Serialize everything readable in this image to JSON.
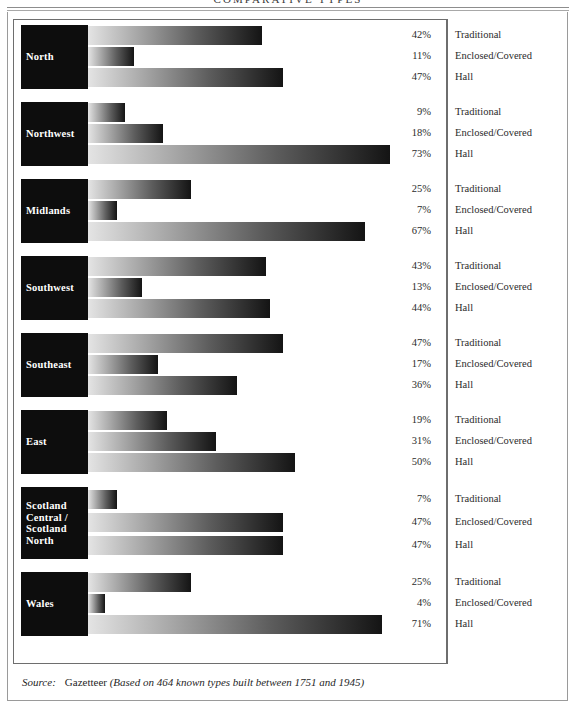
{
  "title": "COMPARATIVE TYPES",
  "source": {
    "label": "Source:",
    "name": "Gazetteer",
    "note": "(Based on 464 known types built between 1751 and 1945)"
  },
  "chart_data": {
    "type": "bar",
    "title": "COMPARATIVE TYPES",
    "orientation": "horizontal",
    "grouped": true,
    "xlabel": "",
    "ylabel": "",
    "xlim": [
      0,
      73
    ],
    "grid": false,
    "legend_position": "right-inline",
    "categories": [
      "North",
      "Northwest",
      "Midlands",
      "Southwest",
      "Southeast",
      "East",
      "Scotland Central / Scotland North",
      "Wales"
    ],
    "series": [
      {
        "name": "Traditional",
        "values": [
          42,
          9,
          25,
          43,
          47,
          19,
          7,
          25
        ]
      },
      {
        "name": "Enclosed/Covered",
        "values": [
          11,
          18,
          7,
          13,
          17,
          31,
          47,
          4
        ]
      },
      {
        "name": "Hall",
        "values": [
          47,
          73,
          67,
          44,
          36,
          50,
          47,
          71
        ]
      }
    ],
    "groups": [
      {
        "region": "North",
        "region_lines": [
          "North"
        ],
        "rows": [
          {
            "value": 42,
            "value_label": "42%",
            "legend": "Traditional"
          },
          {
            "value": 11,
            "value_label": "11%",
            "legend": "Enclosed/Covered"
          },
          {
            "value": 47,
            "value_label": "47%",
            "legend": "Hall"
          }
        ]
      },
      {
        "region": "Northwest",
        "region_lines": [
          "Northwest"
        ],
        "rows": [
          {
            "value": 9,
            "value_label": "9%",
            "legend": "Traditional"
          },
          {
            "value": 18,
            "value_label": "18%",
            "legend": "Enclosed/Covered"
          },
          {
            "value": 73,
            "value_label": "73%",
            "legend": "Hall"
          }
        ]
      },
      {
        "region": "Midlands",
        "region_lines": [
          "Midlands"
        ],
        "rows": [
          {
            "value": 25,
            "value_label": "25%",
            "legend": "Traditional"
          },
          {
            "value": 7,
            "value_label": "7%",
            "legend": "Enclosed/Covered"
          },
          {
            "value": 67,
            "value_label": "67%",
            "legend": "Hall"
          }
        ]
      },
      {
        "region": "Southwest",
        "region_lines": [
          "Southwest"
        ],
        "rows": [
          {
            "value": 43,
            "value_label": "43%",
            "legend": "Traditional"
          },
          {
            "value": 13,
            "value_label": "13%",
            "legend": "Enclosed/Covered"
          },
          {
            "value": 44,
            "value_label": "44%",
            "legend": "Hall"
          }
        ]
      },
      {
        "region": "Southeast",
        "region_lines": [
          "Southeast"
        ],
        "rows": [
          {
            "value": 47,
            "value_label": "47%",
            "legend": "Traditional"
          },
          {
            "value": 17,
            "value_label": "17%",
            "legend": "Enclosed/Covered"
          },
          {
            "value": 36,
            "value_label": "36%",
            "legend": "Hall"
          }
        ]
      },
      {
        "region": "East",
        "region_lines": [
          "East"
        ],
        "rows": [
          {
            "value": 19,
            "value_label": "19%",
            "legend": "Traditional"
          },
          {
            "value": 31,
            "value_label": "31%",
            "legend": "Enclosed/Covered"
          },
          {
            "value": 50,
            "value_label": "50%",
            "legend": "Hall"
          }
        ]
      },
      {
        "region": "Scotland Central / Scotland North",
        "region_lines": [
          "Scotland",
          "Central /",
          "Scotland",
          "North"
        ],
        "rows": [
          {
            "value": 7,
            "value_label": "7%",
            "legend": "Traditional"
          },
          {
            "value": 47,
            "value_label": "47%",
            "legend": "Enclosed/Covered"
          },
          {
            "value": 47,
            "value_label": "47%",
            "legend": "Hall"
          }
        ]
      },
      {
        "region": "Wales",
        "region_lines": [
          "Wales"
        ],
        "rows": [
          {
            "value": 25,
            "value_label": "25%",
            "legend": "Traditional"
          },
          {
            "value": 4,
            "value_label": "4%",
            "legend": "Enclosed/Covered"
          },
          {
            "value": 71,
            "value_label": "71%",
            "legend": "Hall"
          }
        ]
      }
    ]
  }
}
